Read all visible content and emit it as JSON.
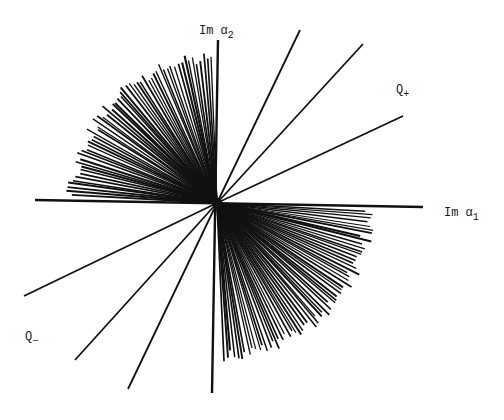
{
  "diagram": {
    "center": [
      217,
      203
    ],
    "stroke_color": "#111111",
    "axes": [
      {
        "name": "im-alpha1-axis",
        "from": [
          35,
          200
        ],
        "to": [
          423,
          207
        ],
        "width": 2.4
      },
      {
        "name": "im-alpha2-axis",
        "from": [
          218,
          40
        ],
        "to": [
          212,
          393
        ],
        "width": 2.4
      }
    ],
    "q_plus_lines": [
      {
        "to": [
          300,
          30
        ]
      },
      {
        "to": [
          363,
          44
        ]
      },
      {
        "to": [
          403,
          116
        ]
      }
    ],
    "q_minus_lines": [
      {
        "to": [
          24,
          296
        ]
      },
      {
        "to": [
          75,
          360
        ]
      },
      {
        "to": [
          128,
          389
        ]
      }
    ],
    "fans": [
      {
        "name": "upper-left-fan",
        "angle_start_deg": 92,
        "angle_end_deg": 178,
        "radius": 150,
        "count": 58
      },
      {
        "name": "lower-right-fan",
        "angle_start_deg": 272,
        "angle_end_deg": 358,
        "radius": 158,
        "count": 62
      }
    ]
  },
  "labels": {
    "im_alpha2": {
      "main": "Im α",
      "sub": "2"
    },
    "im_alpha1": {
      "main": "Im α",
      "sub": "1"
    },
    "q_plus": {
      "main": "Q",
      "sub": "+"
    },
    "q_minus": {
      "main": "Q",
      "sub": "−"
    }
  }
}
